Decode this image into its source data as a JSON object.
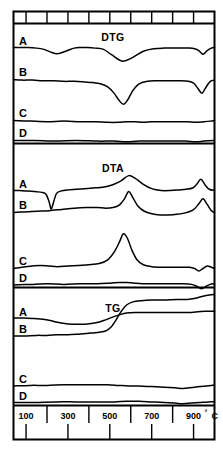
{
  "figure": {
    "panels": [
      {
        "id": "dtg",
        "title": "DTG",
        "curves": [
          "A",
          "B",
          "C",
          "D"
        ]
      },
      {
        "id": "dta",
        "title": "DTA",
        "curves": [
          "A",
          "B",
          "C",
          "D"
        ]
      },
      {
        "id": "tg",
        "title": "TG",
        "curves": [
          "A",
          "B",
          "C",
          "D"
        ]
      }
    ],
    "axis": {
      "unit": "°C",
      "tick_labels": [
        "100",
        "300",
        "500",
        "700",
        "900"
      ],
      "tick_values": [
        100,
        300,
        500,
        700,
        900
      ],
      "minor_ticks": [
        200,
        400,
        600,
        800,
        1000
      ]
    },
    "colors": {
      "ink": "#000000",
      "paper": "#ffffff"
    }
  },
  "chart_data": {
    "type": "line",
    "title": "",
    "xlabel": "°C",
    "ylabel": "",
    "xlim": [
      40,
      1000
    ],
    "grid": false,
    "legend": "none",
    "panels": [
      {
        "name": "DTG",
        "series": [
          {
            "name": "A",
            "x": [
              40,
              70,
              110,
              150,
              185,
              215,
              250,
              290,
              330,
              360,
              395,
              430,
              470,
              510,
              560,
              610,
              660,
              710,
              760,
              800,
              840,
              880,
              905,
              925,
              945,
              965,
              985,
              1000
            ],
            "y": [
              0,
              0,
              0,
              -1,
              -3,
              -7,
              -10,
              -6,
              -1,
              0,
              0,
              -1,
              -3,
              -12,
              -22,
              -16,
              -6,
              -2,
              -1,
              -1,
              -1,
              -1,
              -2,
              -5,
              -11,
              -5,
              -1,
              0
            ]
          },
          {
            "name": "B",
            "x": [
              40,
              80,
              130,
              180,
              230,
              280,
              330,
              380,
              420,
              455,
              490,
              520,
              545,
              565,
              585,
              610,
              640,
              680,
              720,
              760,
              800,
              840,
              875,
              900,
              920,
              940,
              960,
              980,
              1000
            ],
            "y": [
              0,
              -1,
              -1,
              -2,
              -2,
              -3,
              -3,
              -4,
              -5,
              -7,
              -12,
              -22,
              -34,
              -40,
              -33,
              -18,
              -7,
              -3,
              -2,
              -2,
              -2,
              -2,
              -3,
              -6,
              -14,
              -22,
              -12,
              -3,
              -1
            ]
          },
          {
            "name": "C",
            "x": [
              40,
              120,
              200,
              280,
              360,
              430,
              490,
              540,
              580,
              620,
              660,
              700,
              760,
              820,
              870,
              910,
              950,
              980,
              1000
            ],
            "y": [
              0,
              -1,
              -2,
              -1,
              -2,
              -2,
              -3,
              -3,
              -2,
              -2,
              -3,
              -2,
              -2,
              -2,
              -2,
              -3,
              -2,
              -1,
              0
            ]
          },
          {
            "name": "D",
            "x": [
              40,
              140,
              240,
              340,
              440,
              520,
              580,
              640,
              720,
              800,
              860,
              910,
              950,
              1000
            ],
            "y": [
              0,
              0,
              -1,
              0,
              -1,
              -1,
              -2,
              -1,
              -1,
              -1,
              -1,
              -2,
              -1,
              0
            ]
          }
        ]
      },
      {
        "name": "DTA",
        "series": [
          {
            "name": "A",
            "x": [
              40,
              70,
              110,
              150,
              175,
              195,
              210,
              220,
              232,
              245,
              265,
              300,
              340,
              380,
              420,
              455,
              490,
              520,
              555,
              590,
              620,
              660,
              700,
              745,
              790,
              830,
              865,
              895,
              915,
              935,
              955,
              975,
              1000
            ],
            "y": [
              0,
              0,
              -1,
              -2,
              -3,
              -6,
              -18,
              -30,
              -18,
              -5,
              -1,
              1,
              2,
              3,
              4,
              5,
              7,
              10,
              16,
              24,
              20,
              10,
              3,
              0,
              0,
              1,
              2,
              4,
              10,
              18,
              9,
              2,
              0
            ]
          },
          {
            "name": "B",
            "x": [
              40,
              90,
              150,
              210,
              270,
              330,
              390,
              440,
              480,
              515,
              545,
              570,
              590,
              610,
              635,
              665,
              700,
              740,
              780,
              820,
              855,
              885,
              905,
              925,
              945,
              965,
              985,
              1000
            ],
            "y": [
              0,
              1,
              2,
              3,
              5,
              7,
              8,
              8,
              7,
              8,
              12,
              22,
              34,
              24,
              10,
              2,
              -2,
              -4,
              -4,
              -3,
              -1,
              2,
              6,
              14,
              22,
              13,
              3,
              0
            ]
          },
          {
            "name": "C",
            "x": [
              40,
              80,
              130,
              170,
              210,
              250,
              300,
              350,
              400,
              450,
              490,
              520,
              545,
              565,
              585,
              605,
              630,
              660,
              700,
              750,
              800,
              845,
              880,
              905,
              925,
              945,
              965,
              985,
              1000
            ],
            "y": [
              0,
              2,
              4,
              5,
              4,
              3,
              4,
              5,
              6,
              8,
              14,
              26,
              42,
              56,
              48,
              30,
              14,
              6,
              3,
              2,
              2,
              2,
              2,
              0,
              -4,
              0,
              4,
              2,
              0
            ]
          },
          {
            "name": "D",
            "x": [
              40,
              120,
              200,
              280,
              360,
              440,
              500,
              545,
              580,
              620,
              680,
              740,
              800,
              850,
              890,
              915,
              940,
              965,
              990,
              1000
            ],
            "y": [
              0,
              1,
              2,
              1,
              2,
              2,
              3,
              4,
              4,
              3,
              2,
              2,
              2,
              2,
              1,
              -2,
              -6,
              -1,
              2,
              1
            ]
          }
        ]
      },
      {
        "name": "TG",
        "series": [
          {
            "name": "A",
            "x": [
              40,
              90,
              140,
              180,
              215,
              250,
              285,
              320,
              350,
              380,
              410,
              445,
              480,
              510,
              545,
              580,
              620,
              680,
              740,
              800,
              850,
              890,
              920,
              950,
              975,
              1000
            ],
            "y": [
              0,
              0,
              -1,
              -2,
              -4,
              -7,
              -9,
              -10,
              -10,
              -10,
              -9,
              -7,
              -3,
              1,
              5,
              8,
              9,
              9,
              9,
              9,
              9,
              9,
              10,
              11,
              11,
              11
            ]
          },
          {
            "name": "B",
            "x": [
              40,
              90,
              150,
              200,
              250,
              300,
              350,
              390,
              420,
              450,
              480,
              505,
              530,
              555,
              580,
              610,
              650,
              700,
              760,
              820,
              870,
              910,
              945,
              975,
              1000
            ],
            "y": [
              0,
              0,
              1,
              1,
              2,
              2,
              3,
              4,
              5,
              6,
              8,
              14,
              26,
              40,
              50,
              55,
              57,
              58,
              58,
              59,
              59,
              61,
              64,
              66,
              67
            ]
          },
          {
            "name": "C",
            "x": [
              40,
              120,
              200,
              280,
              360,
              430,
              490,
              540,
              590,
              640,
              700,
              760,
              810,
              850,
              880,
              905,
              930,
              960,
              985,
              1000
            ],
            "y": [
              0,
              1,
              1,
              2,
              2,
              2,
              2,
              1,
              0,
              0,
              -1,
              -2,
              -3,
              -4,
              -3,
              -2,
              -1,
              0,
              1,
              1
            ]
          },
          {
            "name": "D",
            "x": [
              40,
              140,
              240,
              340,
              440,
              520,
              580,
              640,
              700,
              760,
              810,
              850,
              890,
              930,
              970,
              1000
            ],
            "y": [
              0,
              0,
              1,
              1,
              1,
              1,
              2,
              2,
              1,
              0,
              -1,
              -2,
              -1,
              0,
              1,
              1
            ]
          }
        ]
      }
    ]
  }
}
